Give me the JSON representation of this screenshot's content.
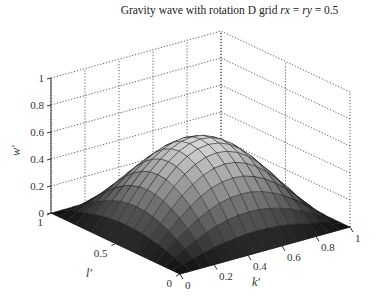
{
  "title": {
    "prefix": "Gravity wave with rotation D grid ",
    "var1": "rx",
    "eq1": " = ",
    "var2": "ry",
    "eq2": " = 0.5"
  },
  "chart_data": {
    "type": "surface3d",
    "title": "Gravity wave with rotation D grid rx = ry = 0.5",
    "xlabel": "k'",
    "ylabel": "l'",
    "zlabel": "w'",
    "xlim": [
      0,
      1
    ],
    "ylim": [
      0,
      1
    ],
    "zlim": [
      0,
      1
    ],
    "x_ticks": [
      "0",
      "0.2",
      "0.4",
      "0.6",
      "0.8",
      "1"
    ],
    "y_ticks": [
      "0",
      "0.5",
      "1"
    ],
    "z_ticks": [
      "0",
      "0.2",
      "0.4",
      "0.6",
      "0.8",
      "1"
    ],
    "grid": true,
    "colormap": "gray",
    "surface": {
      "description": "dome-shaped surface, zero at k'=0,1 and l'=0,1 edges, peak ~0.6 at center",
      "formula": "w' = 0.6 * sin(pi*k') * sin(pi*l')",
      "peak": 0.6,
      "resolution": 16
    }
  }
}
